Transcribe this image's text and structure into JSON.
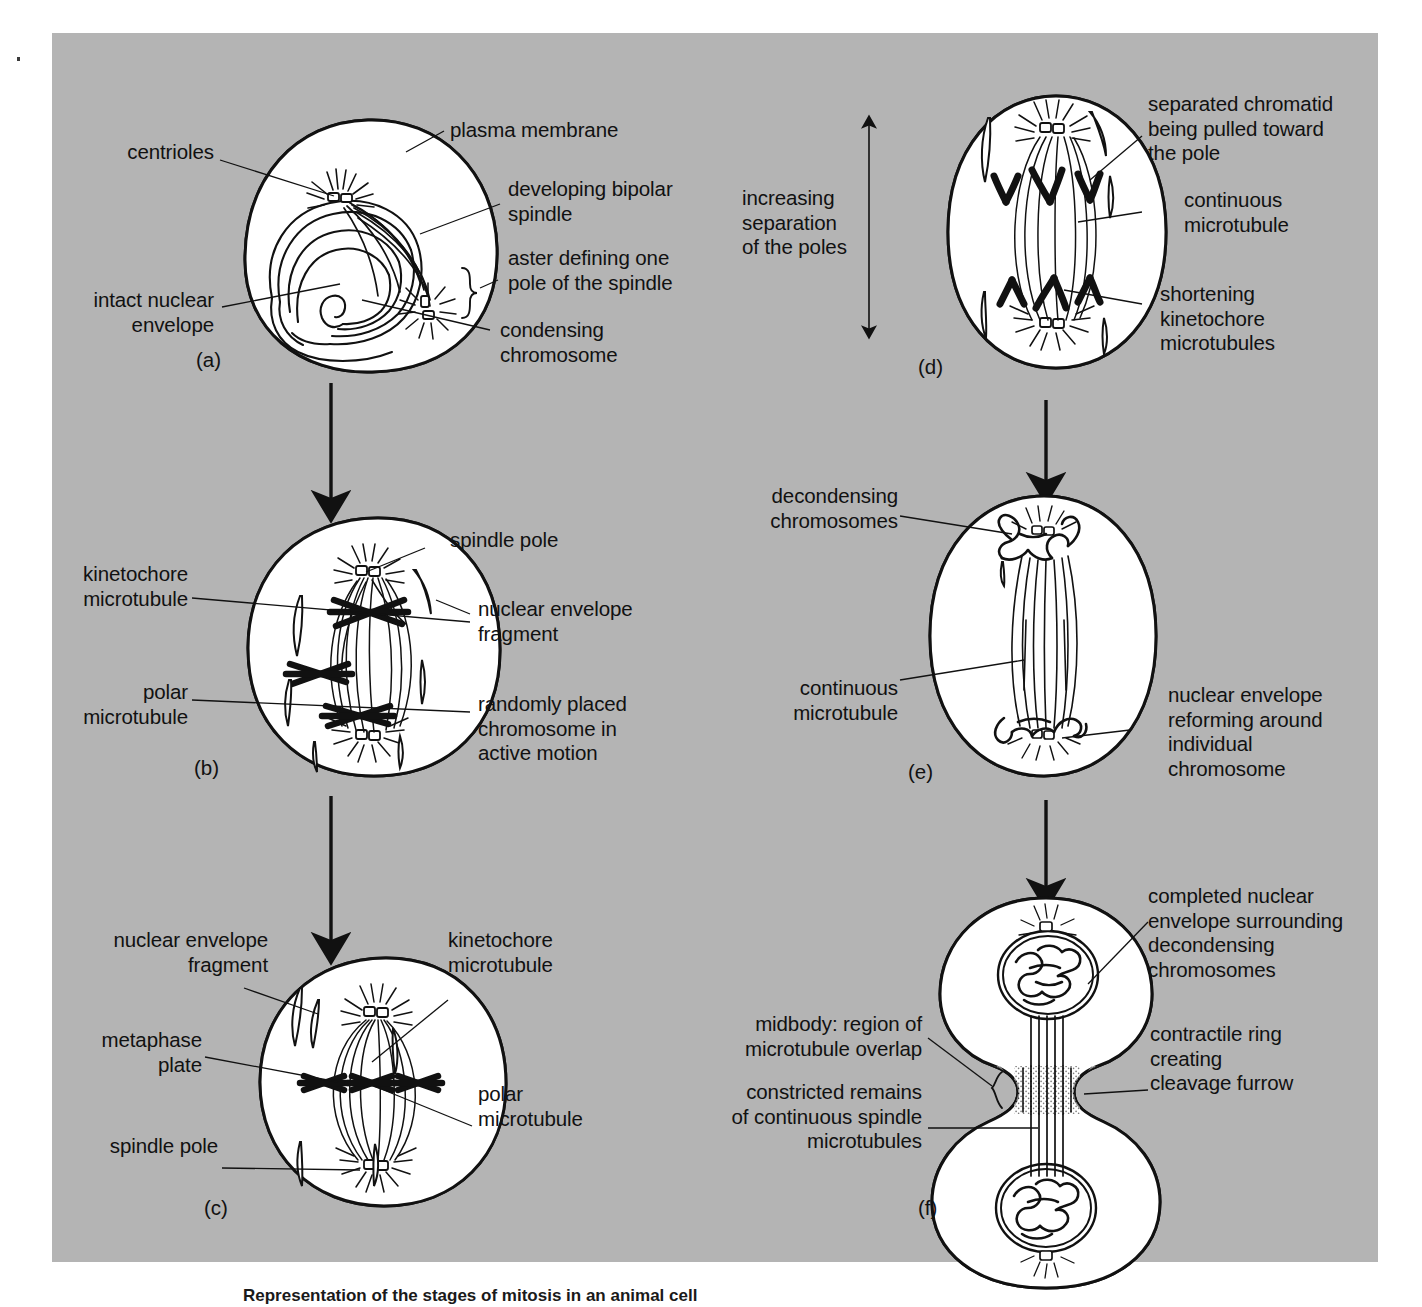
{
  "figure": {
    "background_color": "#b4b4b4",
    "ink_color": "#111111",
    "cell_fill": "#ffffff",
    "caption": "Representation of the stages of mitosis in an animal cell"
  },
  "panels": [
    {
      "id": "a",
      "letter": "(a)",
      "stage": "prophase",
      "labels": [
        {
          "name": "centrioles",
          "text": "centrioles",
          "align": "right"
        },
        {
          "name": "plasma-membrane",
          "text": "plasma membrane",
          "align": "left"
        },
        {
          "name": "developing-bipolar-spindle",
          "text": "developing bipolar\nspindle",
          "align": "left"
        },
        {
          "name": "aster-defining-pole",
          "text": "aster defining one\npole of the spindle",
          "align": "left"
        },
        {
          "name": "intact-nuclear-envelope",
          "text": "intact nuclear\nenvelope",
          "align": "right"
        },
        {
          "name": "condensing-chromosome",
          "text": "condensing\nchromosome",
          "align": "left"
        }
      ]
    },
    {
      "id": "b",
      "letter": "(b)",
      "stage": "prometaphase",
      "labels": [
        {
          "name": "spindle-pole",
          "text": "spindle pole",
          "align": "left"
        },
        {
          "name": "kinetochore-microtubule",
          "text": "kinetochore\nmicrotubule",
          "align": "right"
        },
        {
          "name": "nuclear-envelope-fragment",
          "text": "nuclear envelope\nfragment",
          "align": "left"
        },
        {
          "name": "polar-microtubule",
          "text": "polar\nmicrotubule",
          "align": "right"
        },
        {
          "name": "randomly-placed-chromosome",
          "text": "randomly placed\nchromosome in\nactive motion",
          "align": "left"
        }
      ]
    },
    {
      "id": "c",
      "letter": "(c)",
      "stage": "metaphase",
      "labels": [
        {
          "name": "nuclear-envelope-fragment",
          "text": "nuclear envelope\nfragment",
          "align": "right"
        },
        {
          "name": "kinetochore-microtubule",
          "text": "kinetochore\nmicrotubule",
          "align": "left"
        },
        {
          "name": "metaphase-plate",
          "text": "metaphase\nplate",
          "align": "right"
        },
        {
          "name": "polar-microtubule",
          "text": "polar\nmicrotubule",
          "align": "left"
        },
        {
          "name": "spindle-pole",
          "text": "spindle pole",
          "align": "right"
        }
      ]
    },
    {
      "id": "d",
      "letter": "(d)",
      "stage": "anaphase",
      "labels": [
        {
          "name": "increasing-separation-of-poles",
          "text": "increasing\nseparation\nof the poles",
          "align": "left"
        },
        {
          "name": "separated-chromatid",
          "text": "separated chromatid\nbeing pulled toward\nthe pole",
          "align": "left"
        },
        {
          "name": "continuous-microtubule",
          "text": "continuous\nmicrotubule",
          "align": "left"
        },
        {
          "name": "shortening-kinetochore-microtubules",
          "text": "shortening\nkinetochore\nmicrotubules",
          "align": "left"
        }
      ]
    },
    {
      "id": "e",
      "letter": "(e)",
      "stage": "telophase",
      "labels": [
        {
          "name": "decondensing-chromosomes",
          "text": "decondensing\nchromosomes",
          "align": "right"
        },
        {
          "name": "continuous-microtubule",
          "text": "continuous\nmicrotubule",
          "align": "right"
        },
        {
          "name": "nuclear-envelope-reforming",
          "text": "nuclear envelope\nreforming around\nindividual\nchromosome",
          "align": "left"
        }
      ]
    },
    {
      "id": "f",
      "letter": "(f)",
      "stage": "cytokinesis",
      "labels": [
        {
          "name": "completed-nuclear-envelope",
          "text": "completed nuclear\nenvelope surrounding\ndecondensing\nchromosomes",
          "align": "left"
        },
        {
          "name": "midbody-region",
          "text": "midbody: region of\nmicrotubule overlap",
          "align": "right"
        },
        {
          "name": "contractile-ring",
          "text": "contractile ring\ncreating\ncleavage furrow",
          "align": "left"
        },
        {
          "name": "constricted-remains",
          "text": "constricted remains\nof continuous spindle\nmicrotubules",
          "align": "right"
        }
      ]
    }
  ],
  "flow_arrows": [
    {
      "name": "arrow-a-to-b",
      "from": "a",
      "to": "b"
    },
    {
      "name": "arrow-b-to-c",
      "from": "b",
      "to": "c"
    },
    {
      "name": "arrow-d-to-e",
      "from": "d",
      "to": "e"
    },
    {
      "name": "arrow-e-to-f",
      "from": "e",
      "to": "f"
    }
  ]
}
